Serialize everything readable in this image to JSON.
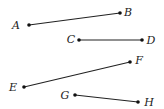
{
  "figure": {
    "segments": [
      {
        "name": "AB",
        "from": "A",
        "to": "B"
      },
      {
        "name": "CD",
        "from": "C",
        "to": "D"
      },
      {
        "name": "EF",
        "from": "E",
        "to": "F"
      },
      {
        "name": "GH",
        "from": "G",
        "to": "H"
      }
    ],
    "points": {
      "A": {
        "label": "A"
      },
      "B": {
        "label": "B"
      },
      "C": {
        "label": "C"
      },
      "D": {
        "label": "D"
      },
      "E": {
        "label": "E"
      },
      "F": {
        "label": "F"
      },
      "G": {
        "label": "G"
      },
      "H": {
        "label": "H"
      }
    }
  }
}
